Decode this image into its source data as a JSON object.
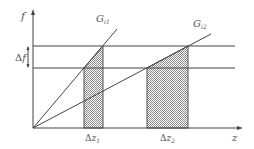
{
  "diagram": {
    "y_axis_label": "f",
    "x_axis_label": "z",
    "delta_f_label": "Δf",
    "delta_f_symbol": "Δ",
    "delta_f_var": "f",
    "line1_label": {
      "main": "G",
      "sub": "i1"
    },
    "line2_label": {
      "main": "G",
      "sub": "i2"
    },
    "region1_label": {
      "delta": "Δ",
      "var": "z",
      "sub": "1"
    },
    "region2_label": {
      "delta": "Δ",
      "var": "z",
      "sub": "2"
    },
    "colors": {
      "line": "#444444",
      "hatch": "#999999",
      "text": "#555555"
    }
  }
}
